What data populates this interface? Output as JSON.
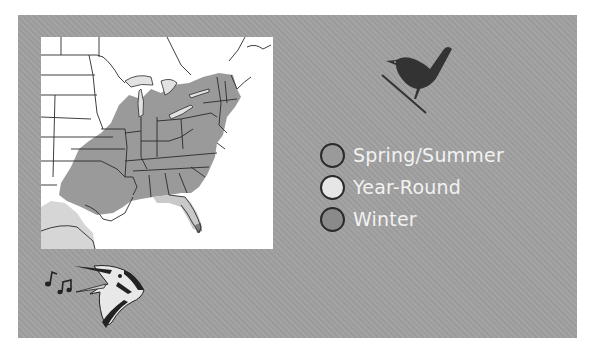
{
  "figure": {
    "type": "bird range map",
    "map_region": "Eastern United States",
    "colors": {
      "panel_background": "#a0a0a0",
      "map_background": "#ffffff",
      "spring_summer": "#9a9a9a",
      "year_round": "#e6e6e6",
      "winter": "#8a8a8a",
      "state_borders": "#2a2a2a"
    }
  },
  "legend": {
    "items": [
      {
        "label": "Spring/Summer",
        "color": "#9a9a9a"
      },
      {
        "label": "Year-Round",
        "color": "#e6e6e6"
      },
      {
        "label": "Winter",
        "color": "#8a8a8a"
      }
    ]
  },
  "icons": {
    "perched_bird": "wren-silhouette-icon",
    "singing_bird": "singing-warbler-icon",
    "music_notes": "music-notes-icon"
  }
}
